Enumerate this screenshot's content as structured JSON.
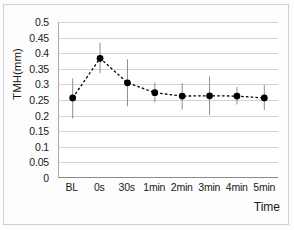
{
  "chart_data": {
    "type": "line",
    "title": "",
    "xlabel": "Time",
    "ylabel": "TMH(mm)",
    "categories": [
      "BL",
      "0s",
      "30s",
      "1min",
      "2min",
      "3min",
      "4min",
      "5min"
    ],
    "values": [
      0.255,
      0.383,
      0.304,
      0.272,
      0.261,
      0.262,
      0.261,
      0.255
    ],
    "error_upper": [
      0.318,
      0.433,
      0.38,
      0.305,
      0.303,
      0.324,
      0.29,
      0.297
    ],
    "error_lower": [
      0.189,
      0.335,
      0.228,
      0.24,
      0.218,
      0.2,
      0.234,
      0.216
    ],
    "ylim": [
      0,
      0.5
    ],
    "ytick_labels": [
      "0.5",
      "0.45",
      "0.4",
      "0.35",
      "0.3",
      "0.25",
      "0.2",
      "0.15",
      "0.1",
      "0.05",
      "0"
    ],
    "ytick_values": [
      0.5,
      0.45,
      0.4,
      0.35,
      0.3,
      0.25,
      0.2,
      0.15,
      0.1,
      0.05,
      0
    ],
    "grid": "horizontal",
    "legend": "none",
    "line_style": "dashed",
    "marker": "filled-circle",
    "colors": {
      "series": "#000000",
      "grid": "#d4d4d4",
      "axis": "#8a8a8a",
      "error_bar": "#8c8c8c",
      "text": "#1a1a1a",
      "background": "#ffffff"
    }
  }
}
